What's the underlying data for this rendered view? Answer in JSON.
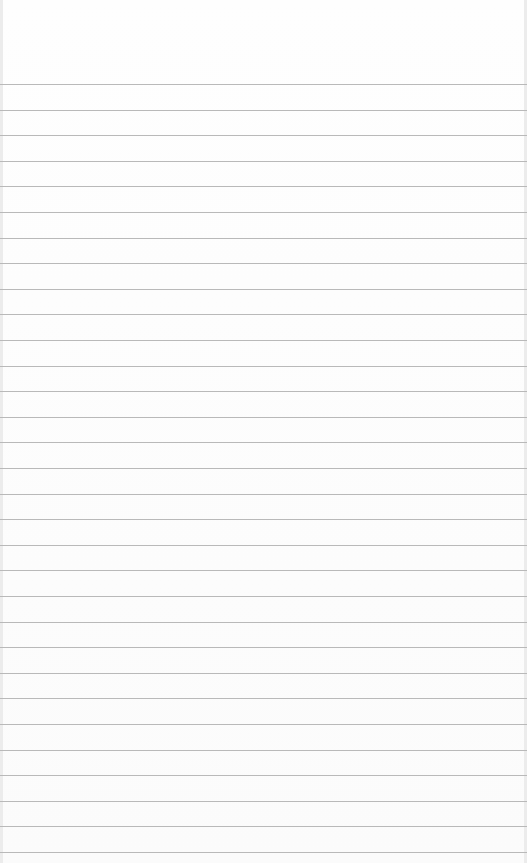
{
  "paper": {
    "type": "blank ruled paper",
    "first_line_y": 84,
    "line_spacing": 25.6,
    "line_count": 31,
    "line_color": "#b9b9b9",
    "background_color": "#fdfdfd"
  }
}
